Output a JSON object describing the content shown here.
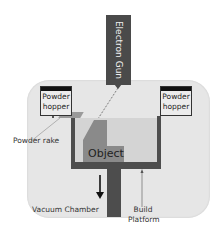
{
  "diagram": {
    "components": {
      "electron_gun": {
        "label": "Electron Gun",
        "color": "#4a4a4a"
      },
      "powder_hopper_left": {
        "line1": "Powder",
        "line2": "hopper"
      },
      "powder_hopper_right": {
        "line1": "Powder",
        "line2": "hopper"
      },
      "powder_rake": {
        "label": "Powder rake"
      },
      "object": {
        "label": "Object",
        "color": "#8a8a8a"
      },
      "vacuum_chamber": {
        "label": "Vacuum Chamber",
        "color": "#e6e6e6"
      },
      "build_platform": {
        "line1": "Build",
        "line2": "Platform",
        "color": "#4d4d4d"
      }
    },
    "arrows": [
      {
        "name": "platform-down-arrow",
        "direction": "down"
      },
      {
        "name": "build-platform-pointer",
        "direction": "up"
      }
    ]
  }
}
